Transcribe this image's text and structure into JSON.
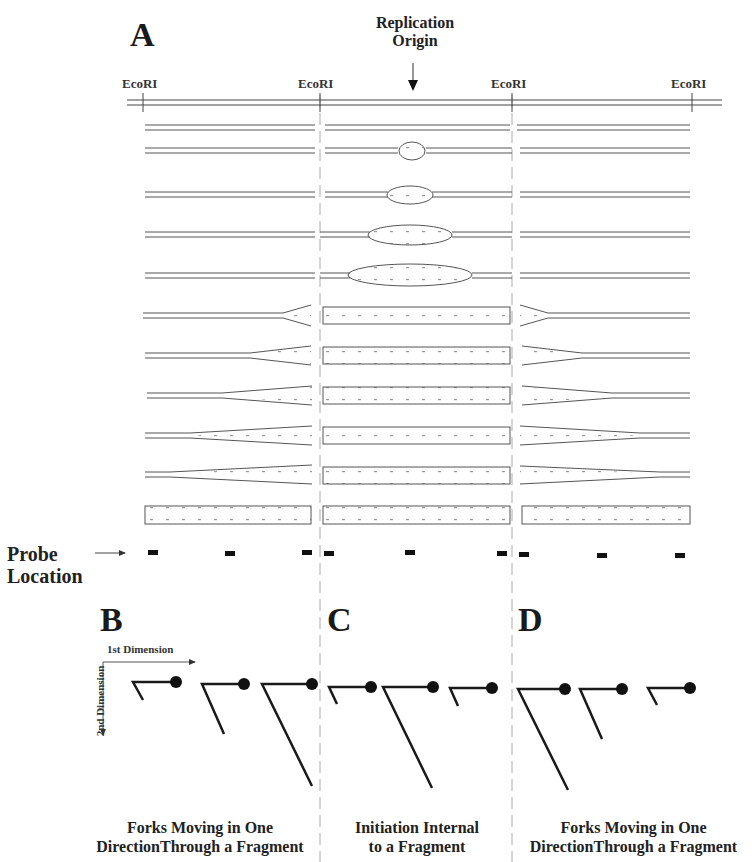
{
  "panel_a": {
    "letter": "A",
    "origin_label_line1": "Replication",
    "origin_label_line2": "Origin",
    "sites": [
      "EcoRI",
      "EcoRI",
      "EcoRI",
      "EcoRI"
    ],
    "probe_label_line1": "Probe",
    "probe_label_line2": "Location",
    "rows": [
      {
        "stage": "unreplicated"
      },
      {
        "stage": "small bubble"
      },
      {
        "stage": "bubble"
      },
      {
        "stage": "larger bubble"
      },
      {
        "stage": "large bubble"
      },
      {
        "stage": "forks entering flanking fragments"
      },
      {
        "stage": "forks moving"
      },
      {
        "stage": "forks moving"
      },
      {
        "stage": "forks moving"
      },
      {
        "stage": "forks nearly complete"
      },
      {
        "stage": "fully replicated"
      }
    ]
  },
  "panel_b": {
    "letter": "B",
    "axis_x_label": "1st Dimension",
    "axis_y_label": "2nd Dimension",
    "caption_line1": "Forks Moving in One",
    "caption_line2": "DirectionThrough a Fragment"
  },
  "panel_c": {
    "letter": "C",
    "caption_line1": "Initiation Internal",
    "caption_line2": "to a Fragment"
  },
  "panel_d": {
    "letter": "D",
    "caption_line1": "Forks Moving in One",
    "caption_line2": "DirectionThrough a Fragment"
  },
  "colors": {
    "line": "#555555",
    "ink": "#111111",
    "dash": "#aaaaaa"
  }
}
